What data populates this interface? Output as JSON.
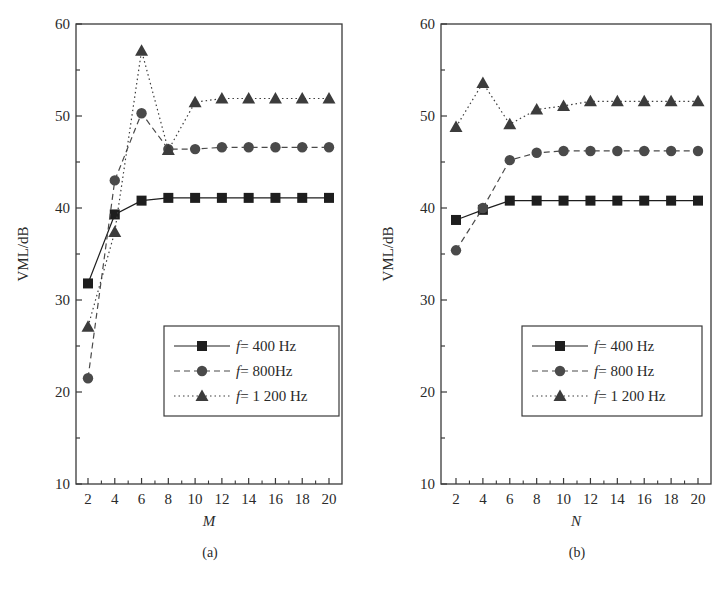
{
  "chart_data": [
    {
      "id": "a",
      "type": "line",
      "panel_label": "(a)",
      "xlabel": "M",
      "ylabel": "VML/dB",
      "ylim": [
        10,
        60
      ],
      "yticks": [
        10,
        20,
        30,
        40,
        50,
        60
      ],
      "xticks": [
        2,
        4,
        6,
        8,
        10,
        12,
        14,
        16,
        18,
        20
      ],
      "x": [
        2,
        4,
        6,
        8,
        10,
        12,
        14,
        16,
        18,
        20
      ],
      "grid": false,
      "legend_position": "lower right",
      "series": [
        {
          "name": "f = 400 Hz",
          "legend_prefix": "f",
          "legend_suffix": "= 400 Hz",
          "marker": "square",
          "line": "solid",
          "values": [
            31.8,
            39.3,
            40.8,
            41.1,
            41.1,
            41.1,
            41.1,
            41.1,
            41.1,
            41.1
          ]
        },
        {
          "name": "f = 800Hz",
          "legend_prefix": "f",
          "legend_suffix": "= 800Hz",
          "marker": "circle",
          "line": "dashed",
          "values": [
            21.5,
            43.0,
            50.3,
            46.4,
            46.4,
            46.6,
            46.6,
            46.6,
            46.6,
            46.6
          ]
        },
        {
          "name": "f = 1 200 Hz",
          "legend_prefix": "f",
          "legend_suffix": "= 1 200 Hz",
          "marker": "triangle",
          "line": "dotted",
          "values": [
            27.1,
            37.4,
            57.1,
            46.3,
            51.5,
            51.9,
            51.9,
            51.9,
            51.9,
            51.9
          ]
        }
      ]
    },
    {
      "id": "b",
      "type": "line",
      "panel_label": "(b)",
      "xlabel": "N",
      "ylabel": "VML/dB",
      "ylim": [
        10,
        60
      ],
      "yticks": [
        10,
        20,
        30,
        40,
        50,
        60
      ],
      "xticks": [
        2,
        4,
        6,
        8,
        10,
        12,
        14,
        16,
        18,
        20
      ],
      "x": [
        2,
        4,
        6,
        8,
        10,
        12,
        14,
        16,
        18,
        20
      ],
      "grid": false,
      "legend_position": "lower right",
      "series": [
        {
          "name": "f = 400 Hz",
          "legend_prefix": "f",
          "legend_suffix": "= 400 Hz",
          "marker": "square",
          "line": "solid",
          "values": [
            38.7,
            39.8,
            40.8,
            40.8,
            40.8,
            40.8,
            40.8,
            40.8,
            40.8,
            40.8
          ]
        },
        {
          "name": "f = 800 Hz",
          "legend_prefix": "f",
          "legend_suffix": "= 800 Hz",
          "marker": "circle",
          "line": "dashed",
          "values": [
            35.4,
            40.0,
            45.2,
            46.0,
            46.2,
            46.2,
            46.2,
            46.2,
            46.2,
            46.2
          ]
        },
        {
          "name": "f = 1 200 Hz",
          "legend_prefix": "f",
          "legend_suffix": "= 1 200 Hz",
          "marker": "triangle",
          "line": "dotted",
          "values": [
            48.8,
            53.6,
            49.1,
            50.7,
            51.1,
            51.6,
            51.6,
            51.6,
            51.6,
            51.6
          ]
        }
      ]
    }
  ],
  "colors": {
    "axis": "#3a3a3a",
    "series_400": "#1e1e1e",
    "series_800": "#4a4a4a",
    "series_1200": "#3c3c3c"
  }
}
